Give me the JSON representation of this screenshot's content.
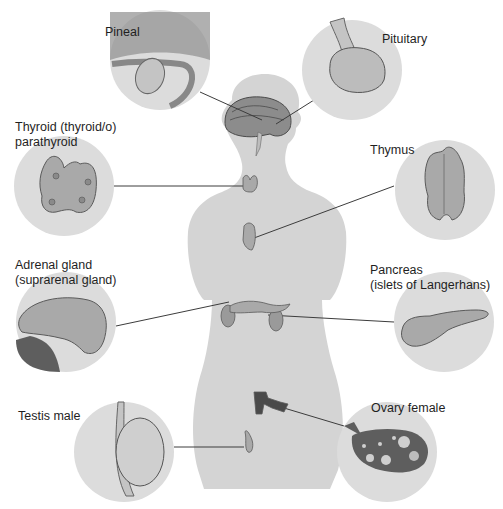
{
  "diagram": {
    "colors": {
      "background": "#ffffff",
      "silhouette": "#d4d4d4",
      "circle_fill": "#dcdcdc",
      "gland_fill": "#a9a9a9",
      "gland_stroke": "#5a5a5a",
      "dark_tissue": "#5e5e5e",
      "leader_line": "#3c3c3c",
      "label_text": "#1f1f1f"
    },
    "labels": {
      "pineal": "Pineal",
      "pituitary": "Pituitary",
      "thyroid_line1": "Thyroid (thyroid/o)",
      "thyroid_line2": "parathyroid",
      "thymus": "Thymus",
      "adrenal_line1": "Adrenal gland",
      "adrenal_line2": "(suprarenal gland)",
      "pancreas_line1": "Pancreas",
      "pancreas_line2": "(islets of Langerhans)",
      "testis": "Testis male",
      "ovary": "Ovary female"
    },
    "callouts": [
      {
        "id": "pineal",
        "circle_center": [
          160,
          60
        ],
        "radius": 50,
        "target": [
          262,
          112
        ]
      },
      {
        "id": "pituitary",
        "circle_center": [
          352,
          70
        ],
        "radius": 50,
        "target": [
          278,
          120
        ]
      },
      {
        "id": "thyroid",
        "circle_center": [
          64,
          186
        ],
        "radius": 50,
        "target": [
          247,
          186
        ]
      },
      {
        "id": "thymus",
        "circle_center": [
          445,
          190
        ],
        "radius": 50,
        "target": [
          254,
          238
        ]
      },
      {
        "id": "adrenal",
        "circle_center": [
          66,
          322
        ],
        "radius": 50,
        "target": [
          231,
          302
        ]
      },
      {
        "id": "pancreas",
        "circle_center": [
          444,
          322
        ],
        "radius": 50,
        "target": [
          268,
          315
        ]
      },
      {
        "id": "testis",
        "circle_center": [
          124,
          452
        ],
        "radius": 50,
        "target": [
          248,
          447
        ]
      },
      {
        "id": "ovary",
        "circle_center": [
          387,
          452
        ],
        "radius": 50,
        "target": [
          283,
          408
        ]
      }
    ]
  }
}
